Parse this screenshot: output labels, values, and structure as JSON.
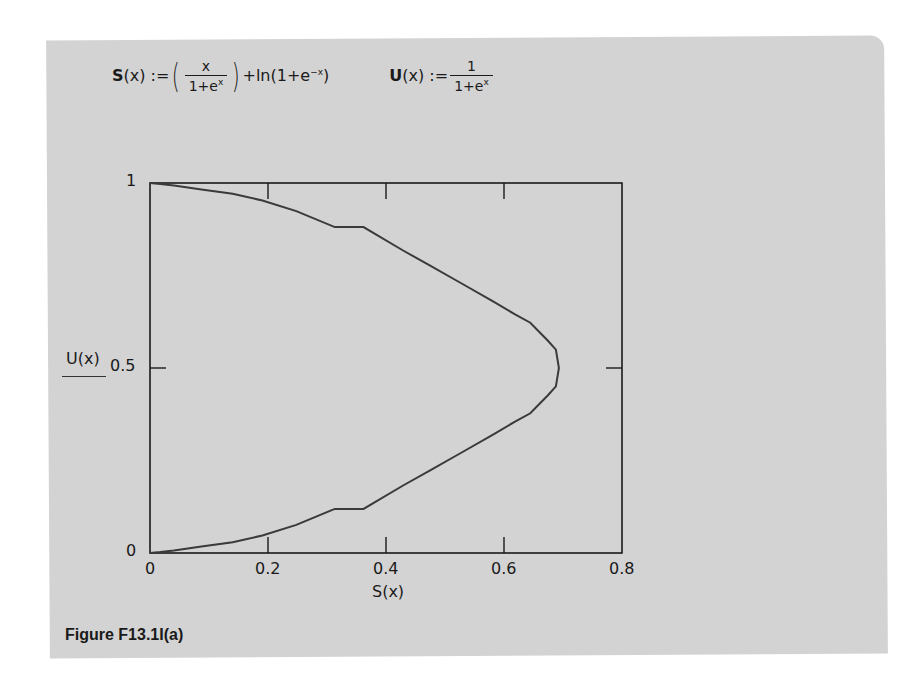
{
  "formulas": {
    "s_name": "S",
    "s_arg": "(x) :=",
    "s_num": "x",
    "s_den": "1+e",
    "s_den_exp": "x",
    "s_tail": "+ln(1+e",
    "s_tail_exp": "−x",
    "s_tail_close": ")",
    "u_name": "U",
    "u_arg": "(x) :=",
    "u_num": "1",
    "u_den": "1+e",
    "u_den_exp": "x"
  },
  "caption": "Figure F13.1I(a)",
  "chart_data": {
    "type": "line",
    "title": "",
    "xlabel": "S(x)",
    "ylabel": "U(x)",
    "xlim": [
      0,
      0.8
    ],
    "ylim": [
      0,
      1
    ],
    "xticks": [
      "0",
      "0.2",
      "0.4",
      "0.6",
      "0.8"
    ],
    "yticks": [
      "0",
      "0.5",
      "1"
    ],
    "grid": false,
    "legend": null,
    "colors": {
      "curve": "#3a3a3a",
      "axes": "#1a1a1a",
      "panel": "#d3d3d3"
    },
    "series": [
      {
        "name": "U(x) vs S(x)",
        "x": [
          0.0,
          0.0174,
          0.0406,
          0.0902,
          0.1402,
          0.1905,
          0.248,
          0.3133,
          0.3618,
          0.429,
          0.474,
          0.5253,
          0.5822,
          0.618,
          0.6446,
          0.6741,
          0.6879,
          0.6931,
          0.6879,
          0.6741,
          0.6446,
          0.618,
          0.5822,
          0.5253,
          0.474,
          0.429,
          0.3618,
          0.3133,
          0.248,
          0.1905,
          0.1402,
          0.0902,
          0.0406,
          0.0174,
          0.0
        ],
        "y": [
          0.0,
          0.0025,
          0.0067,
          0.018,
          0.0293,
          0.0474,
          0.0759,
          0.1192,
          0.1192,
          0.1824,
          0.2227,
          0.2689,
          0.3208,
          0.3543,
          0.3775,
          0.4256,
          0.4502,
          0.5,
          0.5498,
          0.5744,
          0.6225,
          0.6457,
          0.6792,
          0.7311,
          0.7773,
          0.8176,
          0.8808,
          0.8808,
          0.9241,
          0.9526,
          0.9707,
          0.982,
          0.9933,
          0.9975,
          1.0
        ]
      }
    ]
  }
}
